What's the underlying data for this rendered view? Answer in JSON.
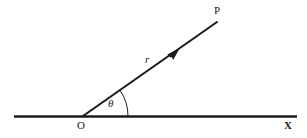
{
  "figure": {
    "type": "vector-angle-diagram",
    "background_color": "#ffffff",
    "stroke_color": "#1b1b1b",
    "labels": {
      "point_p": "P",
      "axis_x": "X",
      "origin": "O",
      "radius": "r",
      "angle": "θ"
    },
    "geometry": {
      "origin": {
        "x": 83,
        "y": 116
      },
      "axis_line": {
        "x1": 14,
        "y1": 116,
        "x2": 297,
        "y2": 116
      },
      "ray": {
        "x1": 83,
        "y1": 116,
        "x2": 217,
        "y2": 22
      },
      "arrow_tip": {
        "x": 180,
        "y": 48
      },
      "arc_radius": 45,
      "angle_degrees": 35
    }
  }
}
